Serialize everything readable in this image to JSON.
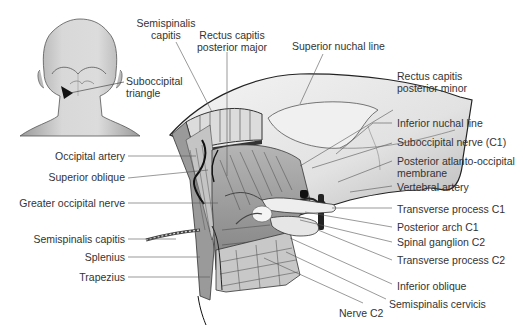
{
  "figure": {
    "inset": {
      "label_line1": "Suboccipital",
      "label_line2": "triangle"
    },
    "labels_top": [
      {
        "id": "semispinalis-capitis-top",
        "line1": "Semispinalis",
        "line2": "capitis"
      },
      {
        "id": "rectus-capitis-posterior-major",
        "line1": "Rectus capitis",
        "line2": "posterior major"
      },
      {
        "id": "superior-nuchal-line",
        "line1": "Superior nuchal line",
        "line2": ""
      }
    ],
    "labels_right": [
      {
        "id": "rectus-capitis-posterior-minor",
        "line1": "Rectus capitis",
        "line2": "posterior minor"
      },
      {
        "id": "inferior-nuchal-line",
        "line1": "Inferior nuchal line",
        "line2": ""
      },
      {
        "id": "suboccipital-nerve",
        "line1": "Suboccipital nerve (C1)",
        "line2": ""
      },
      {
        "id": "posterior-atlanto-occipital-membrane",
        "line1": "Posterior atlanto-occipital",
        "line2": "membrane"
      },
      {
        "id": "vertebral-artery",
        "line1": "Vertebral artery",
        "line2": ""
      },
      {
        "id": "transverse-process-c1",
        "line1": "Transverse process C1",
        "line2": ""
      },
      {
        "id": "posterior-arch-c1",
        "line1": "Posterior arch C1",
        "line2": ""
      },
      {
        "id": "spinal-ganglion-c2",
        "line1": "Spinal ganglion C2",
        "line2": ""
      },
      {
        "id": "transverse-process-c2",
        "line1": "Transverse process C2",
        "line2": ""
      },
      {
        "id": "inferior-oblique",
        "line1": "Inferior oblique",
        "line2": ""
      },
      {
        "id": "semispinalis-cervicis",
        "line1": "Semispinalis cervicis",
        "line2": ""
      }
    ],
    "labels_bottom": [
      {
        "id": "nerve-c2",
        "line1": "Nerve C2"
      }
    ],
    "labels_left": [
      {
        "id": "occipital-artery",
        "line1": "Occipital artery"
      },
      {
        "id": "superior-oblique",
        "line1": "Superior oblique"
      },
      {
        "id": "greater-occipital-nerve",
        "line1": "Greater occipital nerve"
      },
      {
        "id": "semispinalis-capitis-left",
        "line1": "Semispinalis capitis"
      },
      {
        "id": "splenius",
        "line1": "Splenius"
      },
      {
        "id": "trapezius",
        "line1": "Trapezius"
      }
    ]
  }
}
